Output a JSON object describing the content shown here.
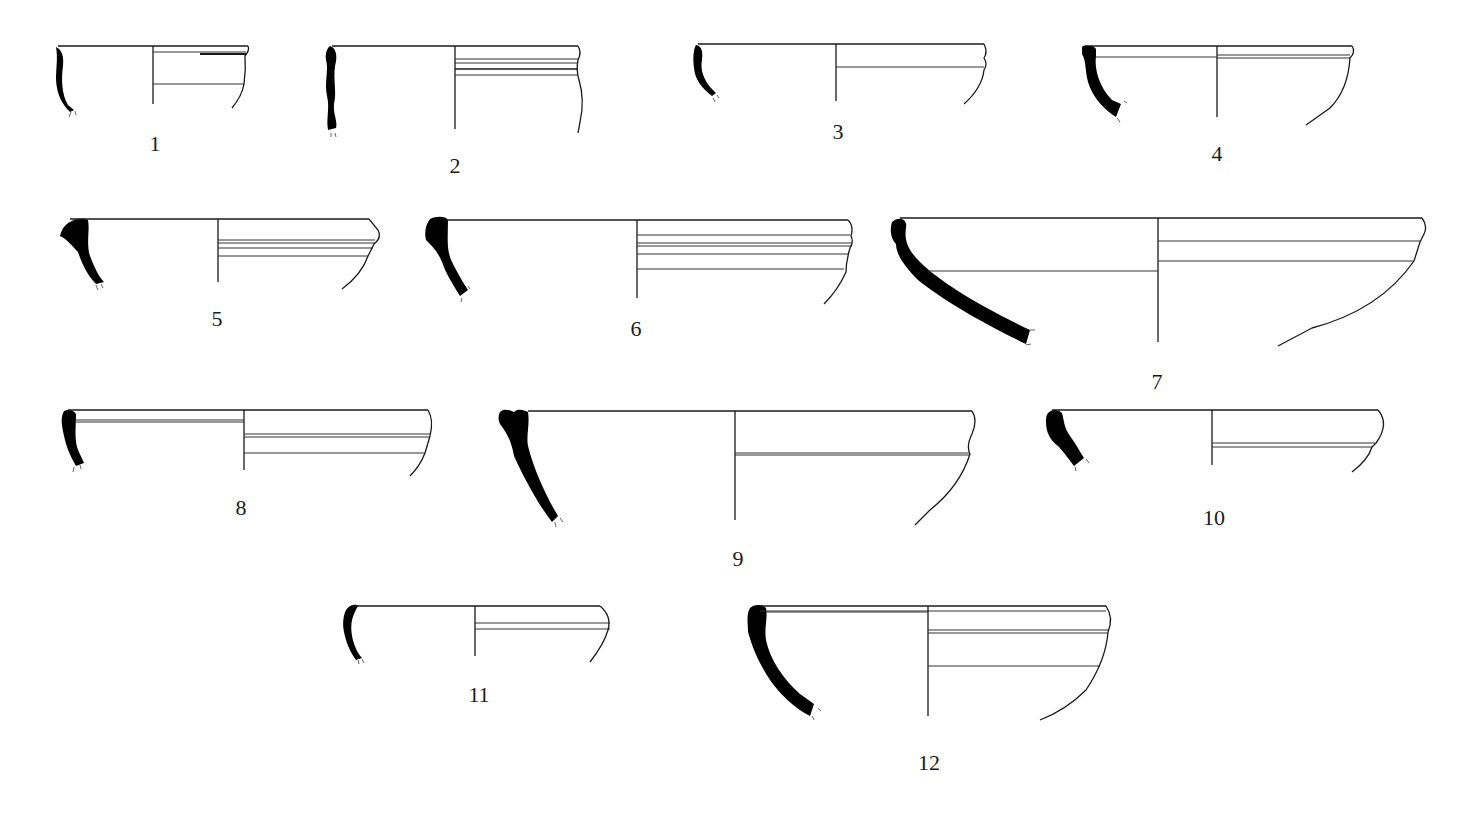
{
  "figure": {
    "type": "pottery rim profile drawings",
    "background": "#ffffff",
    "section_fill": "#000000",
    "line_color": "#1a1a1a"
  },
  "vessels": [
    {
      "id": 1,
      "label": "1",
      "label_pos": [
        155,
        143
      ]
    },
    {
      "id": 2,
      "label": "2",
      "label_pos": [
        455,
        165
      ]
    },
    {
      "id": 3,
      "label": "3",
      "label_pos": [
        838,
        131
      ]
    },
    {
      "id": 4,
      "label": "4",
      "label_pos": [
        1217,
        153
      ]
    },
    {
      "id": 5,
      "label": "5",
      "label_pos": [
        217,
        318
      ]
    },
    {
      "id": 6,
      "label": "6",
      "label_pos": [
        636,
        328
      ]
    },
    {
      "id": 7,
      "label": "7",
      "label_pos": [
        1157,
        381
      ]
    },
    {
      "id": 8,
      "label": "8",
      "label_pos": [
        241,
        507
      ]
    },
    {
      "id": 9,
      "label": "9",
      "label_pos": [
        738,
        558
      ]
    },
    {
      "id": 10,
      "label": "10",
      "label_pos": [
        1214,
        517
      ]
    },
    {
      "id": 11,
      "label": "11",
      "label_pos": [
        479,
        694
      ]
    },
    {
      "id": 12,
      "label": "12",
      "label_pos": [
        929,
        762
      ]
    }
  ]
}
